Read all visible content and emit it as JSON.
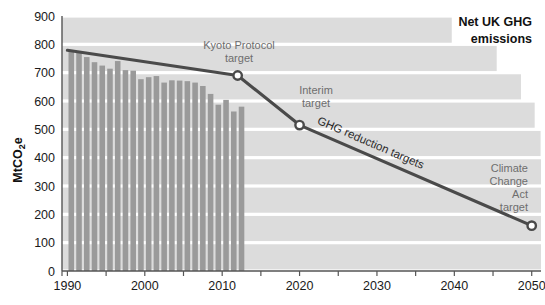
{
  "chart_data": {
    "type": "bar",
    "title": "Net UK GHG emissions",
    "title_line1": "Net UK GHG",
    "title_line2": "emissions",
    "xlabel": "",
    "ylabel": "MtCO2e",
    "ylabel_main": "MtCO",
    "ylabel_sub": "2",
    "ylabel_tail": "e",
    "ylim": [
      0,
      900
    ],
    "xlim": [
      1989,
      2051
    ],
    "grid": true,
    "legend": "none",
    "yticks": [
      0,
      100,
      200,
      300,
      400,
      500,
      600,
      700,
      800,
      900
    ],
    "ytick_labels": [
      "0",
      "100",
      "200",
      "300",
      "400",
      "500",
      "600",
      "700",
      "800",
      "900"
    ],
    "xticks": [
      1990,
      1995,
      2000,
      2005,
      2010,
      2015,
      2020,
      2025,
      2030,
      2035,
      2040,
      2045,
      2050
    ],
    "xtick_labels_shown": [
      "1990",
      "2000",
      "2010",
      "2020",
      "2030",
      "2040",
      "2050"
    ],
    "xtick_labels_values": [
      1990,
      2000,
      2010,
      2020,
      2030,
      2040,
      2050
    ],
    "categories": [
      1990,
      1991,
      1992,
      1993,
      1994,
      1995,
      1996,
      1997,
      1998,
      1999,
      2000,
      2001,
      2002,
      2003,
      2004,
      2005,
      2006,
      2007,
      2008,
      2009,
      2010,
      2011,
      2012
    ],
    "values": [
      779,
      771,
      755,
      737,
      725,
      714,
      741,
      709,
      707,
      677,
      684,
      688,
      665,
      673,
      672,
      670,
      665,
      653,
      625,
      587,
      604,
      563,
      580
    ],
    "series": [
      {
        "name": "Net UK GHG emissions",
        "type": "bar",
        "color": "#9a9a9a",
        "values": [
          779,
          771,
          755,
          737,
          725,
          714,
          741,
          709,
          707,
          677,
          684,
          688,
          665,
          673,
          672,
          670,
          665,
          653,
          625,
          587,
          604,
          563,
          580
        ]
      },
      {
        "name": "GHG reduction targets",
        "type": "line",
        "color": "#4a4a4a",
        "x": [
          1990,
          2012,
          2020,
          2050
        ],
        "y": [
          779,
          690,
          515,
          160
        ],
        "markers": [
          {
            "x": 2012,
            "y": 690,
            "label": "Kyoto Protocol target"
          },
          {
            "x": 2020,
            "y": 515,
            "label": "Interim target"
          },
          {
            "x": 2050,
            "y": 160,
            "label": "Climate Change Act target"
          }
        ]
      }
    ],
    "annotations": [
      {
        "id": "kyoto",
        "lines": [
          "Kyoto Protocol",
          "target"
        ],
        "x": 2012,
        "y": 690,
        "align": "middle"
      },
      {
        "id": "interim",
        "lines": [
          "Interim",
          "target"
        ],
        "x": 2020,
        "y": 515,
        "align": "middle"
      },
      {
        "id": "cca",
        "lines": [
          "Climate",
          "Change",
          "Act",
          "target"
        ],
        "x": 2050,
        "y": 160,
        "align": "end"
      },
      {
        "id": "line-label",
        "lines": [
          "GHG reduction targets"
        ],
        "rotated": true
      }
    ],
    "line_label": "GHG reduction targets"
  },
  "axes": {
    "y_title_main": "MtCO",
    "y_title_sub": "2",
    "y_title_tail": "e",
    "ytick_labels": [
      "900",
      "800",
      "700",
      "600",
      "500",
      "400",
      "300",
      "200",
      "100",
      "0"
    ],
    "xtick_labels": [
      "1990",
      "2000",
      "2010",
      "2020",
      "2030",
      "2040",
      "2050"
    ]
  },
  "title": {
    "line1": "Net UK GHG",
    "line2": "emissions"
  },
  "annotations": {
    "kyoto_l1": "Kyoto Protocol",
    "kyoto_l2": "target",
    "interim_l1": "Interim",
    "interim_l2": "target",
    "cca_l1": "Climate",
    "cca_l2": "Change",
    "cca_l3": "Act",
    "cca_l4": "target",
    "line_label": "GHG reduction targets"
  },
  "colors": {
    "bar": "#9a9a9a",
    "band": "#dcdcdc",
    "line": "#4a4a4a",
    "axis": "#555555",
    "text": "#1a1a1a",
    "anno_text": "#6e6e6e",
    "background": "#ffffff"
  }
}
